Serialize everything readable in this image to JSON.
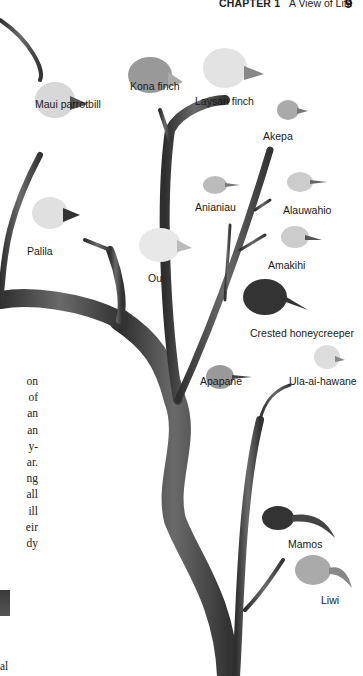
{
  "header": {
    "chapter_label": "CHAPTER 1",
    "chapter_title": "A View of Life",
    "page_number": "9"
  },
  "figure": {
    "type": "phylogenetic-tree-illustration",
    "birds": [
      {
        "name": "Maui parrotbill",
        "x": 35,
        "y": 98
      },
      {
        "name": "Kona finch",
        "x": 130,
        "y": 80
      },
      {
        "name": "Laysan finch",
        "x": 195,
        "y": 95
      },
      {
        "name": "Akepa",
        "x": 263,
        "y": 130
      },
      {
        "name": "Anianiau",
        "x": 195,
        "y": 201
      },
      {
        "name": "Alauwahio",
        "x": 283,
        "y": 204
      },
      {
        "name": "Palila",
        "x": 27,
        "y": 245
      },
      {
        "name": "Amakihi",
        "x": 268,
        "y": 259
      },
      {
        "name": "Ou",
        "x": 148,
        "y": 272
      },
      {
        "name": "Crested honeycreeper",
        "x": 250,
        "y": 327
      },
      {
        "name": "Ula-ai-hawane",
        "x": 289,
        "y": 375
      },
      {
        "name": "Apapane",
        "x": 200,
        "y": 375
      },
      {
        "name": "Mamos",
        "x": 288,
        "y": 538
      },
      {
        "name": "Liwi",
        "x": 321,
        "y": 594
      }
    ]
  },
  "body_text": {
    "line_fragments": [
      "on",
      "of",
      "an",
      "an",
      "y-",
      "ar.",
      "ng",
      "all",
      "ill",
      "eir",
      "dy"
    ],
    "bottom_fragment": "al"
  }
}
